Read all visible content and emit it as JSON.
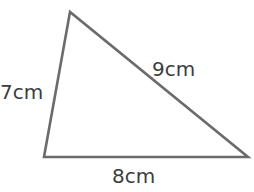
{
  "diagram": {
    "type": "triangle",
    "vertices": {
      "top": [
        70,
        12
      ],
      "bottom_left": [
        44,
        157
      ],
      "bottom_right": [
        248,
        157
      ]
    },
    "stroke_color": "#6b6b6b",
    "text_color": "#3d3d3d",
    "sides": {
      "left": {
        "label": "7cm",
        "length": 7,
        "unit": "cm"
      },
      "hypotenuse": {
        "label": "9cm",
        "length": 9,
        "unit": "cm"
      },
      "base": {
        "label": "8cm",
        "length": 8,
        "unit": "cm"
      }
    }
  }
}
